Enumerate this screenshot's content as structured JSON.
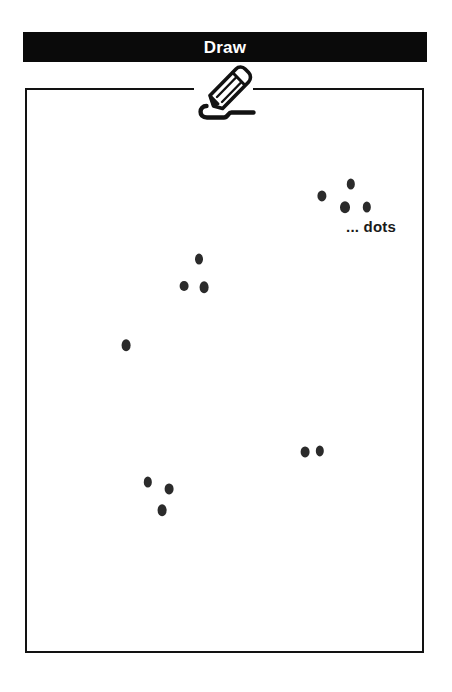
{
  "window": {
    "title": "Draw"
  },
  "toolbar": {
    "pencil_icon": "pencil-draw-icon"
  },
  "canvas": {
    "caption": "... dots",
    "background_color": "#ffffff",
    "border_color": "#121212",
    "dot_color": "#2b2b2b",
    "title_bar_color": "#0a0a0a",
    "title_text_color": "#ffffff",
    "width": 399,
    "height": 565
  },
  "chart_data": {
    "type": "scatter",
    "title": "Draw",
    "annotation": "... dots",
    "xlabel": "",
    "ylabel": "",
    "grid": false,
    "legend": null,
    "xlim": [
      0,
      399
    ],
    "ylim": [
      0,
      565
    ],
    "point_count": 13,
    "group_count": 5,
    "groups": [
      {
        "name": "top-right-cluster",
        "count": 4,
        "points": [
          {
            "x": 297,
            "y": 108,
            "rx": 4.6,
            "ry": 5.6
          },
          {
            "x": 326,
            "y": 96,
            "rx": 4.2,
            "ry": 5.4
          },
          {
            "x": 320,
            "y": 119,
            "rx": 5.0,
            "ry": 5.8
          },
          {
            "x": 342,
            "y": 119,
            "rx": 4.2,
            "ry": 5.4
          }
        ]
      },
      {
        "name": "middle-cluster",
        "count": 3,
        "points": [
          {
            "x": 174,
            "y": 171,
            "rx": 4.0,
            "ry": 5.4
          },
          {
            "x": 159,
            "y": 198,
            "rx": 4.4,
            "ry": 5.0
          },
          {
            "x": 179,
            "y": 199,
            "rx": 4.4,
            "ry": 5.8
          }
        ]
      },
      {
        "name": "left-single-dot",
        "count": 1,
        "points": [
          {
            "x": 101,
            "y": 257,
            "rx": 4.4,
            "ry": 5.8
          }
        ]
      },
      {
        "name": "lower-right-pair",
        "count": 2,
        "points": [
          {
            "x": 280,
            "y": 364,
            "rx": 4.4,
            "ry": 5.6
          },
          {
            "x": 295,
            "y": 363,
            "rx": 4.2,
            "ry": 5.6
          }
        ]
      },
      {
        "name": "bottom-left-cluster",
        "count": 3,
        "points": [
          {
            "x": 123,
            "y": 394,
            "rx": 4.2,
            "ry": 5.4
          },
          {
            "x": 144,
            "y": 401,
            "rx": 4.4,
            "ry": 5.6
          },
          {
            "x": 137,
            "y": 422,
            "rx": 4.4,
            "ry": 5.8
          }
        ]
      }
    ]
  }
}
